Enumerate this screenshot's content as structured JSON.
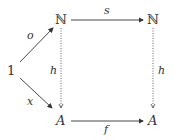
{
  "diagram": {
    "type": "commutative-diagram",
    "nodes": {
      "one": "1",
      "n_left": "ℕ",
      "n_right": "ℕ",
      "a_left": "A",
      "a_right": "A"
    },
    "arrows": {
      "o": {
        "label": "o",
        "from": "1",
        "to": "ℕ (left)",
        "style": "solid"
      },
      "x": {
        "label": "x",
        "from": "1",
        "to": "A (left)",
        "style": "solid"
      },
      "s": {
        "label": "s",
        "from": "ℕ (left)",
        "to": "ℕ (right)",
        "style": "solid"
      },
      "f": {
        "label": "f",
        "from": "A (left)",
        "to": "A (right)",
        "style": "solid"
      },
      "h_left": {
        "label": "h",
        "from": "ℕ (left)",
        "to": "A (left)",
        "style": "dotted"
      },
      "h_right": {
        "label": "h",
        "from": "ℕ (right)",
        "to": "A (right)",
        "style": "dotted"
      }
    },
    "colors": {
      "ink": "#333333",
      "background": "#ffffff"
    }
  }
}
